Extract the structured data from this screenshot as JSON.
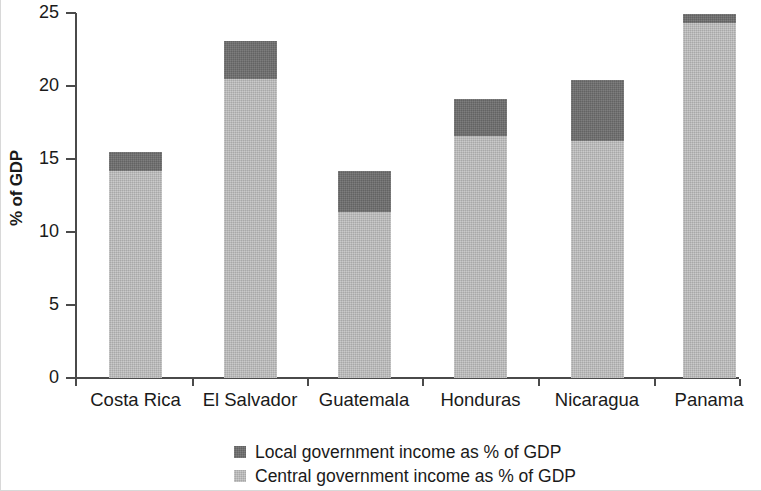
{
  "chart_data": {
    "type": "bar",
    "subtype": "stacked-vertical",
    "title": "",
    "xlabel": "",
    "ylabel": "% of GDP",
    "ylim": [
      0,
      25
    ],
    "yticks": [
      0,
      5,
      10,
      15,
      20,
      25
    ],
    "ytick_labels": [
      "0",
      "5",
      "10",
      "15",
      "20",
      "25"
    ],
    "grid": false,
    "legend_position": "bottom-center",
    "categories": [
      "Costa Rica",
      "El Salvador",
      "Guatemala",
      "Honduras",
      "Nicaragua",
      "Panama"
    ],
    "series": [
      {
        "name": "Central government income as % of GDP",
        "color": "#bcbcbc",
        "values": [
          14.2,
          20.5,
          11.4,
          16.6,
          16.2,
          24.3
        ]
      },
      {
        "name": "Local government income as % of GDP",
        "color": "#6e6e6e",
        "values": [
          1.3,
          2.6,
          2.8,
          2.5,
          4.2,
          0.6
        ]
      }
    ],
    "totals": [
      15.5,
      23.1,
      14.2,
      19.1,
      20.4,
      24.9
    ]
  },
  "legend": {
    "items": [
      {
        "label": "Local government income as % of GDP",
        "color": "#6e6e6e"
      },
      {
        "label": "Central government income as % of GDP",
        "color": "#bcbcbc"
      }
    ]
  }
}
